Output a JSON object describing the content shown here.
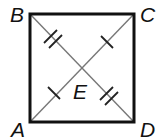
{
  "diagram": {
    "type": "square-with-diagonals",
    "points": {
      "A": {
        "label": "A",
        "x": 30,
        "y": 122
      },
      "B": {
        "label": "B",
        "x": 30,
        "y": 14
      },
      "C": {
        "label": "C",
        "x": 134,
        "y": 14
      },
      "D": {
        "label": "D",
        "x": 134,
        "y": 122
      },
      "E": {
        "label": "E",
        "x": 82,
        "y": 68
      }
    },
    "segments": {
      "sides": [
        "AB",
        "BC",
        "CD",
        "DA"
      ],
      "diagonals": [
        "AC",
        "BD"
      ]
    },
    "congruence_marks": [
      {
        "segment": "BE",
        "ticks": 2
      },
      {
        "segment": "ED",
        "ticks": 2
      },
      {
        "segment": "AE",
        "ticks": 1
      },
      {
        "segment": "EC",
        "ticks": 1
      }
    ],
    "colors": {
      "side": "#111111",
      "diagonal": "#777777",
      "tick": "#222222",
      "label": "#111111"
    }
  }
}
